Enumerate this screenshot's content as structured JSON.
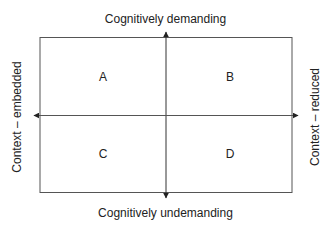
{
  "diagram": {
    "type": "quadrant-matrix",
    "axes": {
      "vertical": {
        "top_label": "Cognitively demanding",
        "bottom_label": "Cognitively undemanding"
      },
      "horizontal": {
        "left_label": "Context – embedded",
        "right_label": "Context – reduced"
      }
    },
    "quadrants": [
      {
        "id": "top-left",
        "label": "A"
      },
      {
        "id": "top-right",
        "label": "B"
      },
      {
        "id": "bottom-left",
        "label": "C"
      },
      {
        "id": "bottom-right",
        "label": "D"
      }
    ],
    "colors": {
      "line": "#555555",
      "text": "#222222",
      "background": "#ffffff"
    }
  }
}
